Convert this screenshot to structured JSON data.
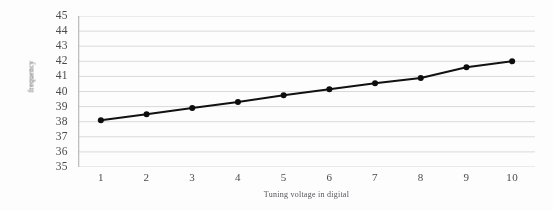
{
  "chart_data": {
    "type": "line",
    "title": "",
    "xlabel": "Tuning voltage in digital",
    "ylabel": "frequency",
    "x": [
      1,
      2,
      3,
      4,
      5,
      6,
      7,
      8,
      9,
      10
    ],
    "categories": [
      "1",
      "2",
      "3",
      "4",
      "5",
      "6",
      "7",
      "8",
      "9",
      "10"
    ],
    "values": [
      38.1,
      38.5,
      38.9,
      39.3,
      39.75,
      40.15,
      40.55,
      40.9,
      41.6,
      42.0
    ],
    "series": [
      {
        "name": "frequency",
        "values": [
          38.1,
          38.5,
          38.9,
          39.3,
          39.75,
          40.15,
          40.55,
          40.9,
          41.6,
          42.0
        ]
      }
    ],
    "xlim": [
      0.5,
      10.5
    ],
    "ylim": [
      35,
      45
    ],
    "ytick_labels": [
      "45",
      "44",
      "43",
      "42",
      "41",
      "40",
      "39",
      "38",
      "37",
      "36",
      "35"
    ],
    "ytick_values": [
      45,
      44,
      43,
      42,
      41,
      40,
      39,
      38,
      37,
      36,
      35
    ],
    "xtick_labels": [
      "1",
      "2",
      "3",
      "4",
      "5",
      "6",
      "7",
      "8",
      "9",
      "10"
    ],
    "grid": "horizontal",
    "legend": "none",
    "colors": {
      "line": "#111111",
      "marker": "#0d0d0d",
      "gridline": "#d9d9d9",
      "axis": "#bfbfbf",
      "text": "#4a4a4f",
      "background": "#fdfdfd"
    },
    "line_width": 2,
    "marker": "circle",
    "marker_size": 6
  }
}
